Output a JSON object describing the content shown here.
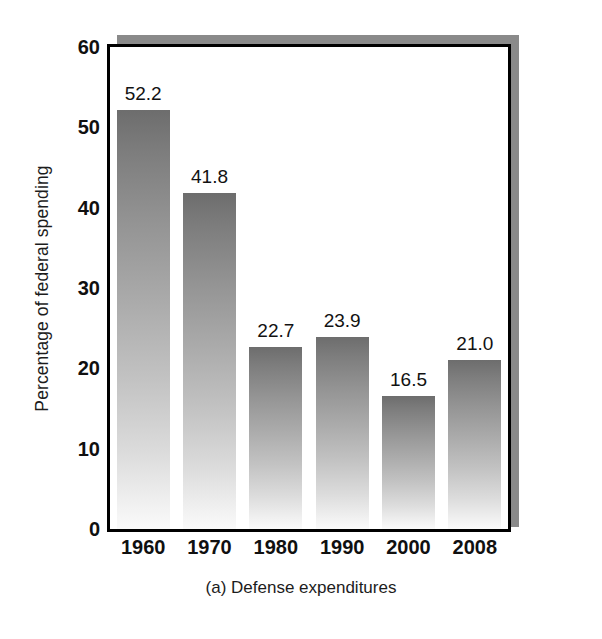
{
  "chart_data": {
    "type": "bar",
    "title": "",
    "caption": "(a) Defense expenditures",
    "xlabel": "",
    "ylabel": "Percentage of federal spending",
    "categories": [
      "1960",
      "1970",
      "1980",
      "1990",
      "2000",
      "2008"
    ],
    "values": [
      52.2,
      41.8,
      22.7,
      23.9,
      16.5,
      21.0
    ],
    "value_labels": [
      "52.2",
      "41.8",
      "22.7",
      "23.9",
      "16.5",
      "21.0"
    ],
    "ylim": [
      0,
      60
    ],
    "yticks": [
      0,
      10,
      20,
      30,
      40,
      50,
      60
    ],
    "ytick_labels": [
      "0",
      "10",
      "20",
      "30",
      "40",
      "50",
      "60"
    ],
    "grid": false,
    "legend": null,
    "legend_position": "none",
    "series": [
      {
        "name": "Defense expenditures",
        "values": [
          52.2,
          41.8,
          22.7,
          23.9,
          16.5,
          21.0
        ]
      }
    ]
  },
  "style": {
    "bar_gradient_top": "#6d6d6d",
    "bar_gradient_bottom": "#fafafa",
    "frame_color": "#000000",
    "shadow_color": "#8a8a8a",
    "background": "#ffffff",
    "text_color": "#101010"
  }
}
